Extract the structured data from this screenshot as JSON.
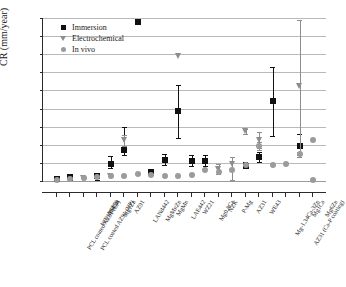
{
  "chart_data": {
    "type": "scatter",
    "title": "",
    "xlabel": "",
    "ylabel": "CR (mm/year)",
    "ylim": [
      0,
      9
    ],
    "yticks": [
      "0",
      "1",
      "2",
      "3",
      "4",
      "5",
      "6",
      "7",
      "8",
      "9"
    ],
    "grid": true,
    "legend_position": "top-left",
    "legend": [
      {
        "name": "Immersion",
        "marker": "square",
        "color": "#111111"
      },
      {
        "name": "Electrochemical",
        "marker": "triangle-down",
        "color": "#8d8d8d"
      },
      {
        "name": "In vivo",
        "marker": "circle",
        "color": "#9b9b9b"
      }
    ],
    "categories": [
      "PCL coated AZ91 (LP)",
      "PCL coated AZ91 (HP)",
      "WE1094Ca",
      "WZ10",
      "Mg1Zn",
      "AZ91",
      "LANd442",
      "MgMnZn",
      "MgMn",
      "LAE442",
      "WZ21",
      "Mg0.8Ca",
      "NZK",
      "P-Mg",
      "AZ31",
      "WE43",
      "Mg-1.34Ca-3Zn",
      "AZ31 (Ca-P coating)",
      "Mg1Ca",
      "Mg6Zn"
    ],
    "series": [
      {
        "name": "Immersion",
        "values": [
          0.12,
          0.22,
          null,
          0.3,
          0.95,
          1.7,
          8.8,
          0.5,
          1.15,
          3.87,
          1.12,
          1.08,
          null,
          null,
          0.85,
          1.33,
          4.4,
          null,
          1.95,
          null
        ],
        "err_low": [
          0.05,
          0.05,
          null,
          0.05,
          0.7,
          1.45,
          null,
          0.42,
          0.88,
          2.4,
          0.82,
          0.82,
          null,
          null,
          0.72,
          1.05,
          2.48,
          null,
          1.35,
          null
        ],
        "err_high": [
          0.18,
          0.3,
          null,
          0.38,
          1.38,
          2.98,
          null,
          0.6,
          1.48,
          5.28,
          1.45,
          1.42,
          null,
          null,
          1.05,
          1.58,
          6.32,
          null,
          2.58,
          null
        ]
      },
      {
        "name": "Electrochemical",
        "values": [
          null,
          null,
          0.18,
          null,
          0.28,
          2.25,
          null,
          null,
          null,
          6.9,
          null,
          null,
          0.66,
          0.95,
          2.78,
          2.28,
          null,
          null,
          5.25,
          null
        ],
        "err_low": [
          null,
          null,
          null,
          null,
          null,
          1.92,
          null,
          null,
          null,
          null,
          null,
          null,
          0.38,
          0.05,
          2.62,
          1.82,
          null,
          null,
          1.42,
          null
        ],
        "err_high": [
          null,
          null,
          null,
          null,
          null,
          2.52,
          null,
          null,
          null,
          null,
          null,
          null,
          0.92,
          1.3,
          2.88,
          2.7,
          null,
          null,
          8.9,
          null
        ]
      },
      {
        "name": "In vivo",
        "values": [
          0.08,
          0.12,
          0.15,
          0.22,
          0.3,
          0.25,
          0.4,
          0.33,
          0.28,
          0.28,
          0.35,
          0.58,
          0.52,
          0.58,
          0.88,
          1.95,
          0.88,
          0.92,
          1.48,
          2.27
        ],
        "err_low": [
          null,
          null,
          null,
          null,
          null,
          null,
          null,
          null,
          null,
          null,
          null,
          null,
          null,
          null,
          null,
          1.72,
          null,
          null,
          1.32,
          null
        ],
        "err_high": [
          null,
          null,
          null,
          null,
          null,
          null,
          null,
          null,
          null,
          null,
          null,
          null,
          null,
          null,
          null,
          2.18,
          null,
          null,
          1.62,
          null
        ]
      },
      {
        "name": "In vivo extra",
        "values": [
          null,
          null,
          null,
          null,
          null,
          null,
          null,
          null,
          null,
          null,
          null,
          null,
          null,
          null,
          null,
          null,
          null,
          null,
          null,
          0.08
        ]
      }
    ]
  }
}
